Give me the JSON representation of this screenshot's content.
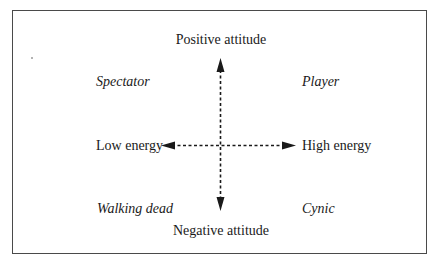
{
  "diagram": {
    "type": "quadrant",
    "colors": {
      "frame": "#4a4a4a",
      "arrow": "#1a1a1a",
      "text": "#1a1a1a",
      "background": "#ffffff"
    },
    "axes": {
      "vertical": {
        "top_label": "Positive attitude",
        "bottom_label": "Negative attitude",
        "style": "dashed-double-arrow"
      },
      "horizontal": {
        "left_label": "Low energy",
        "right_label": "High energy",
        "style": "dashed-double-arrow"
      }
    },
    "quadrants": {
      "top_left": "Spectator",
      "top_right": "Player",
      "bottom_left": "Walking dead",
      "bottom_right": "Cynic"
    }
  }
}
